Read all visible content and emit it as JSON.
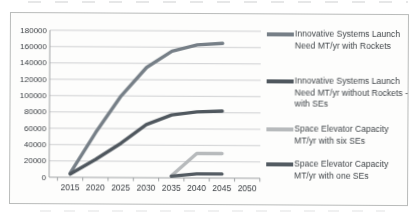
{
  "chart_data": {
    "type": "line",
    "x_categories": [
      "2015",
      "2020",
      "2025",
      "2030",
      "2035",
      "2040",
      "2045",
      "2050"
    ],
    "series": [
      {
        "name": "Innovative Systems Launch Need MT/yr with Rockets",
        "color": "#767f87",
        "values": [
          5000,
          55000,
          100000,
          135000,
          155000,
          163000,
          165000,
          null
        ]
      },
      {
        "name": "Innovative Systems Launch Need MT/yr without Rockets - with SEs",
        "color": "#4f575e",
        "values": [
          4000,
          22000,
          42000,
          65000,
          77000,
          81000,
          82000,
          null
        ]
      },
      {
        "name": "Space Elevator Capacity MT/yr with six SEs",
        "color": "#b7babc",
        "values": [
          null,
          null,
          null,
          null,
          2500,
          30000,
          30000,
          null
        ]
      },
      {
        "name": "Space Elevator Capacity MT/yr with one SEs",
        "color": "#535b62",
        "values": [
          null,
          null,
          null,
          null,
          2000,
          5000,
          5000,
          null
        ]
      }
    ],
    "title": "",
    "xlabel": "",
    "ylabel": "",
    "ylim": [
      0,
      180000
    ],
    "ytick_step": 20000,
    "yticks": [
      "180000",
      "160000",
      "140000",
      "120000",
      "100000",
      "80000",
      "60000",
      "40000",
      "20000",
      "0"
    ],
    "grid": true,
    "legend_position": "right",
    "axis_color": "#9fa2a4",
    "gridline_color": "#cfd0d2",
    "tick_label_color": "#3c4045"
  }
}
